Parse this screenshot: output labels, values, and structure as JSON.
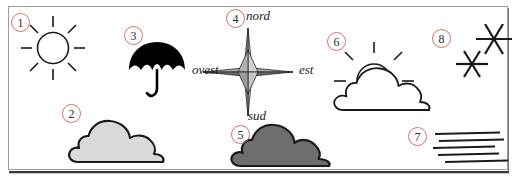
{
  "figure": {
    "background_color": "#ffffff",
    "frame_color": "#9c9c9c",
    "badge_color": "#c9766a"
  },
  "badges": [
    {
      "id": "1",
      "label": "1",
      "refers_to": "sun-icon"
    },
    {
      "id": "2",
      "label": "2",
      "refers_to": "light-cloud-icon"
    },
    {
      "id": "3",
      "label": "3",
      "refers_to": "umbrella-icon"
    },
    {
      "id": "4",
      "label": "4",
      "refers_to": "compass-rose-icon"
    },
    {
      "id": "5",
      "label": "5",
      "refers_to": "dark-cloud-icon"
    },
    {
      "id": "6",
      "label": "6",
      "refers_to": "sun-behind-cloud-icon"
    },
    {
      "id": "7",
      "label": "7",
      "refers_to": "fog-lines-icon"
    },
    {
      "id": "8",
      "label": "8",
      "refers_to": "snowflakes-icon"
    }
  ],
  "compass": {
    "north_label": "nord",
    "west_label": "ovest",
    "east_label": "est",
    "south_label": "sud",
    "point_light_color": "#c4c4c4",
    "point_dark_color": "#555555"
  },
  "icons": [
    {
      "name": "sun-icon",
      "description": "sun with eight rays, open outline circle",
      "fill": "none",
      "stroke": "#1a1a1a"
    },
    {
      "name": "light-cloud-icon",
      "description": "cloud, light grey fill",
      "fill": "#d9d9d9",
      "stroke": "#1a1a1a"
    },
    {
      "name": "umbrella-icon",
      "description": "black umbrella with hooked handle",
      "fill": "#000000",
      "stroke": "#000000"
    },
    {
      "name": "compass-rose-icon",
      "description": "four-point compass star, grey shaded",
      "fill": "#9a9a9a",
      "stroke": "#1a1a1a"
    },
    {
      "name": "dark-cloud-icon",
      "description": "cloud, dark grey fill",
      "fill": "#6e6e6e",
      "stroke": "#1a1a1a"
    },
    {
      "name": "sun-behind-cloud-icon",
      "description": "sun partly hidden behind white cloud",
      "fill": "#ffffff",
      "stroke": "#1a1a1a"
    },
    {
      "name": "fog-lines-icon",
      "description": "five stacked horizontal fog lines",
      "fill": "none",
      "stroke": "#1a1a1a"
    },
    {
      "name": "snowflakes-icon",
      "description": "two six-pointed snowflake asterisks",
      "fill": "none",
      "stroke": "#1a1a1a"
    }
  ]
}
